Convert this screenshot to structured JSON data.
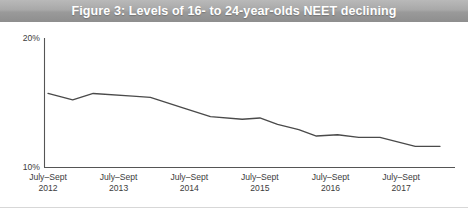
{
  "title": "Figure 3: Levels of 16- to 24-year-olds NEET declining",
  "colors": {
    "title_bar": "#a8a8a8",
    "title_text": "#ffffff",
    "axis": "#555555",
    "line": "#4a4a4a",
    "tick_text": "#3c3c3c"
  },
  "chart_data": {
    "type": "line",
    "title": "Figure 3: Levels of 16- to 24-year-olds NEET declining",
    "xlabel": "",
    "ylabel": "",
    "ylim": [
      10,
      20
    ],
    "yticks": [
      10,
      20
    ],
    "ytick_labels": [
      "10%",
      "20%"
    ],
    "grid": false,
    "legend": false,
    "categories": [
      "July–Sept 2012",
      "July–Sept 2013",
      "July–Sept 2014",
      "July–Sept 2015",
      "July–Sept 2016",
      "July–Sept 2017"
    ],
    "xtick_labels": [
      {
        "line1": "July–Sept",
        "line2": "2012"
      },
      {
        "line1": "July–Sept",
        "line2": "2013"
      },
      {
        "line1": "July–Sept",
        "line2": "2014"
      },
      {
        "line1": "July–Sept",
        "line2": "2015"
      },
      {
        "line1": "July–Sept",
        "line2": "2016"
      },
      {
        "line1": "July–Sept",
        "line2": "2017"
      }
    ],
    "series": [
      {
        "name": "16- to 24-year-olds NEET",
        "points": [
          {
            "x": 0.0,
            "y": 15.7
          },
          {
            "x": 0.35,
            "y": 15.2
          },
          {
            "x": 0.64,
            "y": 15.7
          },
          {
            "x": 1.2,
            "y": 15.5
          },
          {
            "x": 1.45,
            "y": 15.4
          },
          {
            "x": 1.9,
            "y": 14.6
          },
          {
            "x": 2.3,
            "y": 13.9
          },
          {
            "x": 2.75,
            "y": 13.7
          },
          {
            "x": 3.0,
            "y": 13.8
          },
          {
            "x": 3.25,
            "y": 13.3
          },
          {
            "x": 3.55,
            "y": 12.9
          },
          {
            "x": 3.8,
            "y": 12.4
          },
          {
            "x": 4.1,
            "y": 12.5
          },
          {
            "x": 4.4,
            "y": 12.3
          },
          {
            "x": 4.7,
            "y": 12.3
          },
          {
            "x": 5.2,
            "y": 11.6
          },
          {
            "x": 5.55,
            "y": 11.6
          }
        ]
      }
    ]
  }
}
